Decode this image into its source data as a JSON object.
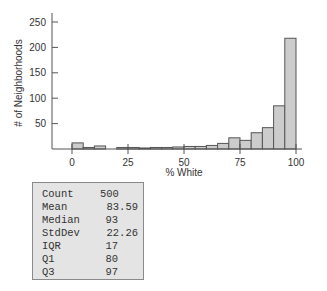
{
  "chart_data": {
    "type": "bar",
    "subtype": "histogram",
    "title": "",
    "xlabel": "% White",
    "ylabel": "# of Neighborhoods",
    "xlim": [
      0,
      100
    ],
    "ylim": [
      0,
      260
    ],
    "x_ticks": [
      0,
      25,
      50,
      75,
      100
    ],
    "y_ticks": [
      50,
      100,
      150,
      200,
      250
    ],
    "bin_width": 5,
    "bin_edges": [
      0,
      5,
      10,
      15,
      20,
      25,
      30,
      35,
      40,
      45,
      50,
      55,
      60,
      65,
      70,
      75,
      80,
      85,
      90,
      95,
      100
    ],
    "categories": [
      "0-5",
      "5-10",
      "10-15",
      "15-20",
      "20-25",
      "25-30",
      "30-35",
      "35-40",
      "40-45",
      "45-50",
      "50-55",
      "55-60",
      "60-65",
      "65-70",
      "70-75",
      "75-80",
      "80-85",
      "85-90",
      "90-95",
      "95-100"
    ],
    "values": [
      12,
      3,
      6,
      0,
      3,
      3,
      2,
      3,
      3,
      4,
      5,
      5,
      7,
      11,
      22,
      17,
      32,
      42,
      85,
      218
    ],
    "grid": false,
    "legend": null,
    "colors": {
      "bar_fill": "#cccccc",
      "bar_stroke": "#555555",
      "axis": "#555555"
    }
  },
  "stats": {
    "rows": [
      {
        "label": "Count",
        "value": "500"
      },
      {
        "label": "Mean",
        "value": "83.59"
      },
      {
        "label": "Median",
        "value": "93"
      },
      {
        "label": "StdDev",
        "value": "22.26"
      },
      {
        "label": "IQR",
        "value": "17"
      },
      {
        "label": "Q1",
        "value": "80"
      },
      {
        "label": "Q3",
        "value": "97"
      }
    ]
  }
}
